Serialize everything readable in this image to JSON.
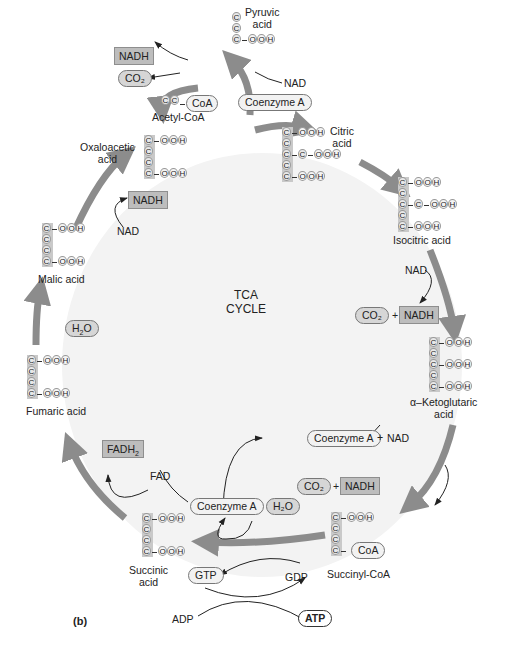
{
  "figure_label": "(b)",
  "center_title": [
    "TCA",
    "CYCLE"
  ],
  "colors": {
    "cycle_arrow": "#8c8c8c",
    "disc_background": "#f3f3f3",
    "chain_highlight": "#c9c9c9",
    "box_fill": "#bdbdbd",
    "oval_fill": "#d6d6d6"
  },
  "intermediates": [
    {
      "name": "Pyruvic acid",
      "label_lines": [
        "Pyruvic",
        "acid"
      ],
      "formula": [
        "C",
        "C",
        "C-OOH"
      ]
    },
    {
      "name": "Acetyl-CoA",
      "label_lines": [
        "Acetyl-CoA"
      ],
      "formula": [
        "C-C-CoA"
      ]
    },
    {
      "name": "Citric acid",
      "label_lines": [
        "Citric",
        "acid"
      ],
      "formula": [
        "C-OOH",
        "C",
        "C-C-OOH",
        "C",
        "C-OOH"
      ]
    },
    {
      "name": "Isocitric acid",
      "label_lines": [
        "Isocitric acid"
      ],
      "formula": [
        "C-OOH",
        "C",
        "C-C-OOH",
        "C",
        "C-OOH"
      ]
    },
    {
      "name": "α-Ketoglutaric acid",
      "label_lines": [
        "α–Ketoglutaric",
        "acid"
      ],
      "formula": [
        "C-OOH",
        "C",
        "C-OOH",
        "C",
        "C-OOH"
      ]
    },
    {
      "name": "Succinyl-CoA",
      "label_lines": [
        "Succinyl-CoA"
      ],
      "formula": [
        "C-OOH",
        "C",
        "C",
        "C-CoA"
      ]
    },
    {
      "name": "Succinic acid",
      "label_lines": [
        "Succinic",
        "acid"
      ],
      "formula": [
        "C-OOH",
        "C",
        "C",
        "C-OOH"
      ]
    },
    {
      "name": "Fumaric acid",
      "label_lines": [
        "Fumaric acid"
      ],
      "formula": [
        "C-OOH",
        "C",
        "C",
        "C-OOH"
      ]
    },
    {
      "name": "Malic acid",
      "label_lines": [
        "Malic acid"
      ],
      "formula": [
        "C-OOH",
        "C",
        "C",
        "C-OOH"
      ]
    },
    {
      "name": "Oxaloacetic acid",
      "label_lines": [
        "Oxaloacetic",
        "acid"
      ],
      "formula": [
        "C-OOH",
        "C",
        "C",
        "C-OOH"
      ]
    }
  ],
  "cofactors": {
    "top": {
      "nadh": "NADH",
      "co2": "CO₂",
      "nad": "NAD",
      "coenzyme_a": "Coenzyme A",
      "coa": "CoA"
    },
    "isocitrate": {
      "nad": "NAD",
      "co2": "CO₂",
      "plus": "+",
      "nadh": "NADH"
    },
    "ketoglutarate": {
      "coenzyme_a": "Coenzyme A",
      "plus1": "+",
      "nad": "NAD",
      "co2": "CO₂",
      "plus2": "+",
      "nadh": "NADH"
    },
    "succinyl": {
      "coa": "CoA",
      "coenzyme_a": "Coenzyme A",
      "h2o": "H₂O",
      "gtp": "GTP",
      "gdp": "GDP",
      "adp": "ADP",
      "atp": "ATP"
    },
    "succinate": {
      "fad": "FAD",
      "fadh2": "FADH₂"
    },
    "fumarate": {
      "h2o": "H₂O"
    },
    "malate": {
      "nad": "NAD",
      "nadh": "NADH"
    }
  }
}
